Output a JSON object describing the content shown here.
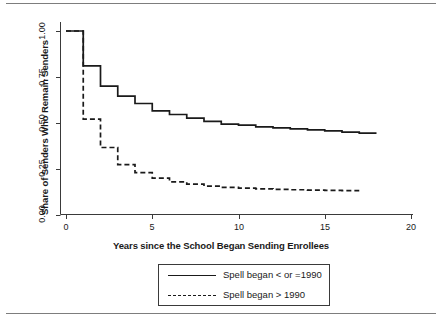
{
  "figure": {
    "has_top_rule": true,
    "has_bottom_rule": true,
    "rule_color": "#7d7d7d"
  },
  "chart_data": {
    "type": "line",
    "subtype": "step-survival",
    "title": "",
    "xlabel": "Years since the School Began Sending Enrollees",
    "ylabel": "Share of Senders Who Remain Senders",
    "xlim": [
      0,
      20
    ],
    "ylim": [
      0,
      1.05
    ],
    "xticks": [
      0,
      5,
      10,
      15,
      20
    ],
    "xtick_labels": [
      "0",
      "5",
      "10",
      "15",
      "20"
    ],
    "yticks": [
      0.0,
      0.25,
      0.5,
      0.75,
      1.0
    ],
    "ytick_labels": [
      "0.00",
      "0.25",
      "0.50",
      "0.75",
      "1.00"
    ],
    "grid": false,
    "legend_position": "below-axes",
    "series": [
      {
        "name": "Spell began < or =1990",
        "style": "solid",
        "color": "#1a1a1a",
        "x": [
          0,
          1,
          2,
          3,
          4,
          5,
          6,
          7,
          8,
          9,
          10,
          11,
          12,
          13,
          14,
          15,
          16,
          17,
          18
        ],
        "y": [
          1.0,
          0.81,
          0.7,
          0.645,
          0.605,
          0.565,
          0.545,
          0.525,
          0.508,
          0.493,
          0.487,
          0.478,
          0.472,
          0.467,
          0.461,
          0.456,
          0.449,
          0.443,
          0.443
        ]
      },
      {
        "name": "Spell began > 1990",
        "style": "dashed",
        "color": "#1a1a1a",
        "x": [
          0,
          1,
          2,
          3,
          4,
          5,
          6,
          7,
          8,
          9,
          10,
          11,
          12,
          13,
          14,
          15,
          16,
          17
        ],
        "y": [
          1.0,
          0.52,
          0.365,
          0.272,
          0.228,
          0.198,
          0.178,
          0.166,
          0.155,
          0.148,
          0.144,
          0.14,
          0.137,
          0.135,
          0.133,
          0.131,
          0.13,
          0.13
        ]
      }
    ]
  },
  "legend": {
    "items": [
      {
        "label": "Spell began < or =1990",
        "style": "solid"
      },
      {
        "label": "Spell began > 1990",
        "style": "dashed"
      }
    ]
  }
}
